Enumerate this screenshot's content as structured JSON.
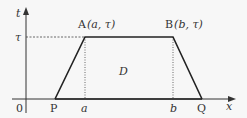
{
  "diagram": {
    "type": "trapezoid-on-axes",
    "background": "#f7f7f7",
    "stroke_color": "#222222",
    "axes": {
      "x_label": "x",
      "y_label": "t",
      "origin_label": "0"
    },
    "levels": {
      "tau_label": "τ"
    },
    "points": {
      "A": {
        "label": "A",
        "coords": "(a, τ)"
      },
      "B": {
        "label": "B",
        "coords": "(b, τ)"
      },
      "P": {
        "label": "P"
      },
      "Q": {
        "label": "Q"
      }
    },
    "ticks": {
      "a": "a",
      "b": "b"
    },
    "region_label": "D"
  }
}
